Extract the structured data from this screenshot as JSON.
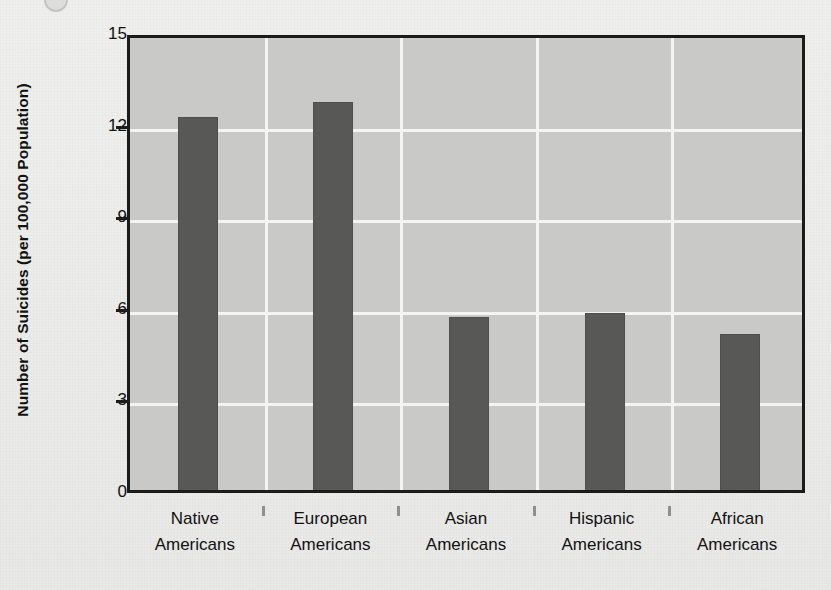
{
  "figure": {
    "marker_icon": "circle-marker-icon"
  },
  "chart_data": {
    "type": "bar",
    "title": "",
    "subtitle": "",
    "xlabel": "",
    "ylabel": "Number of Suicides (per 100,000 Population)",
    "categories": [
      "Native Americans",
      "European Americans",
      "Asian Americans",
      "Hispanic Americans",
      "African Americans"
    ],
    "category_lines": [
      [
        "Native",
        "Americans"
      ],
      [
        "European",
        "Americans"
      ],
      [
        "Asian",
        "Americans"
      ],
      [
        "Hispanic",
        "Americans"
      ],
      [
        "African",
        "Americans"
      ]
    ],
    "values": [
      12.4,
      12.9,
      5.85,
      6.0,
      5.3
    ],
    "ylim": [
      0,
      15
    ],
    "yticks": [
      0,
      3,
      6,
      9,
      12,
      15
    ],
    "ytick_labels": [
      "0",
      "3",
      "6",
      "9",
      "12",
      "15"
    ],
    "grid": "both",
    "legend": "none",
    "series": [
      {
        "name": "Number of Suicides (per 100,000 Population)",
        "values": [
          12.4,
          12.9,
          5.85,
          6.0,
          5.3
        ]
      }
    ],
    "colors": {
      "bar": "#585856",
      "plot_background": "#c9c9c7",
      "page_background": "#ececea",
      "gridline": "#f4f4f2",
      "axis_border": "#1b1b1b",
      "text": "#111111"
    }
  }
}
